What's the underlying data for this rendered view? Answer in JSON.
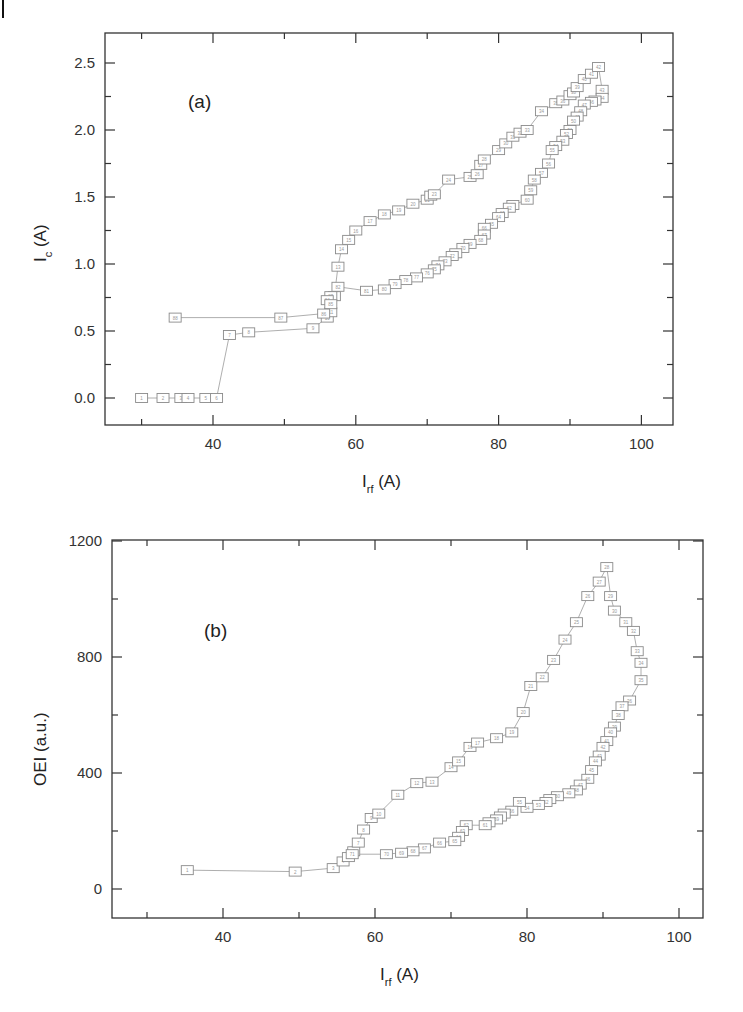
{
  "figure": {
    "panels": [
      {
        "label": "(a)",
        "ylabel_main": "I",
        "ylabel_sub": "c",
        "ylabel_unit": " (A)",
        "xlabel_main": "I",
        "xlabel_sub": "rf",
        "xlabel_unit": " (A)"
      },
      {
        "label": "(b)",
        "ylabel_main": "OEI (a.u.)",
        "xlabel_main": "I",
        "xlabel_sub": "rf",
        "xlabel_unit": " (A)"
      }
    ]
  },
  "chart_data": [
    {
      "type": "line",
      "title": "(a)",
      "xlabel": "I_rf (A)",
      "ylabel": "I_c (A)",
      "xlim": [
        25,
        105
      ],
      "ylim": [
        -0.2,
        2.7
      ],
      "xticks": [
        40,
        60,
        80,
        100
      ],
      "yticks": [
        0.0,
        0.5,
        1.0,
        1.5,
        2.0,
        2.5
      ],
      "grid": false,
      "marker": "open-square",
      "series": [
        {
          "name": "sweep",
          "x": [
            30,
            33,
            35.5,
            36.5,
            39,
            40.5,
            42.3,
            45,
            54,
            56,
            56.5,
            57,
            57.5,
            58,
            59,
            60,
            62,
            64,
            66,
            68,
            70,
            70.5,
            71,
            73,
            76,
            77,
            77.5,
            78,
            80,
            81,
            82,
            83,
            84,
            86,
            88,
            89,
            90,
            90.5,
            91,
            92,
            93,
            94,
            94.5,
            94.5,
            93.5,
            93,
            92,
            91.5,
            91,
            90.5,
            90,
            89.5,
            89,
            88,
            87.5,
            87,
            86,
            85,
            84.5,
            84,
            82,
            81.5,
            80.5,
            80,
            79,
            78,
            78,
            77.5,
            76,
            75,
            74,
            73.5,
            72.5,
            71.5,
            71,
            70,
            68.5,
            67,
            65.5,
            64,
            61.5,
            57.5,
            56.5,
            56,
            56.5,
            55.5,
            49.5,
            34.7
          ],
          "y": [
            0.0,
            0.0,
            0.0,
            0.0,
            0.0,
            0.0,
            0.47,
            0.49,
            0.52,
            0.6,
            0.64,
            0.76,
            0.98,
            1.11,
            1.18,
            1.25,
            1.32,
            1.37,
            1.4,
            1.45,
            1.48,
            1.51,
            1.52,
            1.63,
            1.65,
            1.67,
            1.74,
            1.78,
            1.85,
            1.9,
            1.95,
            1.98,
            2.0,
            2.14,
            2.2,
            2.22,
            2.26,
            2.28,
            2.32,
            2.38,
            2.42,
            2.47,
            2.3,
            2.24,
            2.22,
            2.21,
            2.19,
            2.14,
            2.1,
            2.07,
            2.0,
            1.97,
            1.92,
            1.88,
            1.85,
            1.75,
            1.68,
            1.63,
            1.55,
            1.48,
            1.44,
            1.42,
            1.38,
            1.35,
            1.3,
            1.27,
            1.22,
            1.18,
            1.15,
            1.12,
            1.08,
            1.06,
            1.02,
            0.99,
            0.96,
            0.93,
            0.9,
            0.88,
            0.85,
            0.81,
            0.8,
            0.83,
            0.76,
            0.73,
            0.7,
            0.63,
            0.6,
            0.6
          ]
        }
      ]
    },
    {
      "type": "line",
      "title": "(b)",
      "xlabel": "I_rf (A)",
      "ylabel": "OEI (a.u.)",
      "xlim": [
        25,
        105
      ],
      "ylim": [
        -100,
        1200
      ],
      "xticks": [
        40,
        60,
        80,
        100
      ],
      "yticks": [
        0,
        400,
        800,
        1200
      ],
      "grid": false,
      "marker": "open-square",
      "series": [
        {
          "name": "sweep",
          "x": [
            35.3,
            49.5,
            54.5,
            55.8,
            56.5,
            57.2,
            57.8,
            58.5,
            59.5,
            60.5,
            63,
            65.5,
            67.5,
            70,
            71,
            72.5,
            73.5,
            76,
            78,
            79.5,
            80.5,
            82,
            83.5,
            85,
            86.5,
            88,
            89.5,
            90.5,
            91,
            91.5,
            93,
            94,
            94.5,
            95,
            95,
            93.5,
            92.5,
            92,
            91.5,
            91,
            90.5,
            90,
            89.5,
            89,
            88.5,
            88,
            87,
            86.5,
            85.5,
            84,
            83,
            82.5,
            81.5,
            80,
            79,
            78,
            77,
            76.5,
            76,
            75,
            74.5,
            72,
            71.5,
            71,
            70.5,
            68.5,
            66.5,
            65,
            63.5,
            61.5,
            57
          ],
          "y": [
            65,
            60,
            72,
            95,
            110,
            130,
            160,
            205,
            245,
            260,
            325,
            365,
            370,
            420,
            440,
            490,
            505,
            520,
            540,
            610,
            700,
            730,
            790,
            860,
            920,
            1010,
            1060,
            1110,
            1010,
            960,
            920,
            890,
            820,
            780,
            720,
            650,
            630,
            600,
            560,
            540,
            510,
            490,
            460,
            440,
            410,
            380,
            360,
            340,
            330,
            320,
            310,
            300,
            290,
            280,
            300,
            270,
            260,
            250,
            240,
            230,
            220,
            220,
            200,
            180,
            165,
            160,
            140,
            130,
            125,
            120,
            120
          ]
        }
      ]
    }
  ]
}
